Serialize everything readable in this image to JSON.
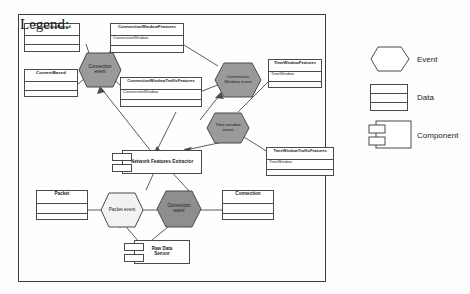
{
  "diagram": {
    "colors": {
      "event_gray": "#9a9a9a",
      "event_white": "#f2f2f2",
      "stroke": "#4a4a4a",
      "frame": "#3a3a3a",
      "background": "#fefefe"
    },
    "data_boxes": [
      {
        "id": "connection-based",
        "title": "ConnectionBased",
        "attribute": "",
        "rows": 2
      },
      {
        "id": "content-based",
        "title": "ContentBased",
        "attribute": "",
        "rows": 2
      },
      {
        "id": "connection-window-features",
        "title": "ConnectionWindowFeatures",
        "attribute": "ConnectionWindow",
        "rows": 2
      },
      {
        "id": "connection-window-traffic-features",
        "title": "ConnectionWindowTrafficFeatures",
        "attribute": "ConnectionWindow",
        "rows": 2
      },
      {
        "id": "time-window-features",
        "title": "TimeWindowFeatures",
        "attribute": "TimeWindow",
        "rows": 2
      },
      {
        "id": "time-window-traffic-features",
        "title": "TimeWindowTrafficFeatures",
        "attribute": "TimeWindow",
        "rows": 2
      },
      {
        "id": "packet",
        "title": "Packet",
        "attribute": "",
        "rows": 2
      },
      {
        "id": "connection",
        "title": "Connection",
        "attribute": "",
        "rows": 2
      }
    ],
    "events": [
      {
        "id": "connection-event-top",
        "label_line1": "Connection",
        "label_line2": "event",
        "fill": "gray"
      },
      {
        "id": "connection-window-event",
        "label_line1": "Connection",
        "label_line2": "Window event",
        "fill": "gray"
      },
      {
        "id": "time-window-event",
        "label_line1": "Time window",
        "label_line2": "event",
        "fill": "gray"
      },
      {
        "id": "packet-event",
        "label_line1": "Packet event",
        "label_line2": "",
        "fill": "white"
      },
      {
        "id": "connection-event-bottom",
        "label_line1": "Connection",
        "label_line2": "event",
        "fill": "gray"
      }
    ],
    "components": [
      {
        "id": "network-features-extractor",
        "label_line1": "Network Features Extractor",
        "label_line2": ""
      },
      {
        "id": "raw-data-sensor",
        "label_line1": "Raw Data",
        "label_line2": "Sensor"
      }
    ]
  },
  "legend": {
    "title": "Legend:",
    "items": [
      {
        "id": "event",
        "label": "Event",
        "shape": "hexagon"
      },
      {
        "id": "data",
        "label": "Data",
        "shape": "three-row-box"
      },
      {
        "id": "component",
        "label": "Component",
        "shape": "component-box"
      }
    ]
  }
}
